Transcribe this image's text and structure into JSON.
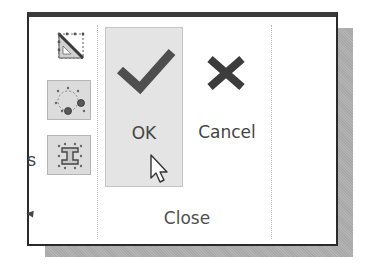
{
  "ribbon_panel": {
    "left_group": {
      "partial_label": "s",
      "tools": [
        {
          "name": "sketch-triangle-tool",
          "icon": "setsquare-icon",
          "highlighted": false
        },
        {
          "name": "sketch-circle-grips-tool",
          "icon": "circle-grips-icon",
          "highlighted": true
        },
        {
          "name": "sketch-ibeam-tool",
          "icon": "ibeam-icon",
          "highlighted": true
        }
      ],
      "dropdown_icon": "dropdown-triangle-icon"
    },
    "close_group": {
      "label": "Close",
      "buttons": [
        {
          "id": "ok",
          "label": "OK",
          "icon": "checkmark-icon",
          "hovered": true
        },
        {
          "id": "cancel",
          "label": "Cancel",
          "icon": "x-icon",
          "hovered": false
        }
      ]
    },
    "cursor": "arrow-cursor-icon"
  },
  "colors": {
    "frame": "#2a2a2a",
    "hover_bg": "#e4e4e4",
    "icon_dark": "#4a4a4a",
    "text": "#444444",
    "shadow": "#b3b3b3"
  }
}
